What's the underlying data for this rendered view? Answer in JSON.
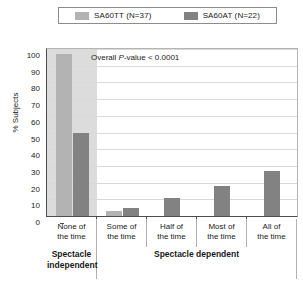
{
  "legend": {
    "entries": [
      {
        "label": "SA60TT (N=37)",
        "color": "#b3b3b3",
        "swatch_name": "legend-swatch-sa60tt"
      },
      {
        "label": "SA60AT (N=22)",
        "color": "#828282",
        "swatch_name": "legend-swatch-sa60at"
      }
    ]
  },
  "annotation": {
    "prefix": "Overall ",
    "italic": "P",
    "suffix": "-value < 0.0001"
  },
  "grouping": {
    "independent_label": "Spectacle independent",
    "dependent_label": "Spectacle dependent"
  },
  "chart_data": {
    "type": "bar",
    "title": "",
    "xlabel": "",
    "ylabel": "% Subjects",
    "ylim": [
      0,
      100
    ],
    "yticks": [
      0,
      10,
      20,
      30,
      40,
      50,
      60,
      70,
      80,
      90,
      100
    ],
    "ytick_labels": [
      "0",
      "10",
      "20",
      "30",
      "40",
      "50",
      "60",
      "70",
      "80",
      "90",
      "100"
    ],
    "grid": true,
    "legend_position": "top",
    "categories": [
      "None of\nthe time",
      "Some of\nthe time",
      "Half of\nthe time",
      "Most of\nthe time",
      "All of\nthe time"
    ],
    "category_lines": [
      [
        "None of",
        "the time"
      ],
      [
        "Some of",
        "the time"
      ],
      [
        "Half of",
        "the time"
      ],
      [
        "Most of",
        "the time"
      ],
      [
        "All of",
        "the time"
      ]
    ],
    "series": [
      {
        "name": "SA60TT (N=37)",
        "color": "#b3b3b3",
        "values": [
          97,
          3,
          0,
          0,
          0
        ]
      },
      {
        "name": "SA60AT (N=22)",
        "color": "#828282",
        "values": [
          50,
          5,
          11,
          18,
          27
        ]
      }
    ],
    "annotations": [
      "Overall P-value < 0.0001"
    ],
    "shaded_region": {
      "category_index": 0,
      "color": "#dcdcdc"
    }
  }
}
